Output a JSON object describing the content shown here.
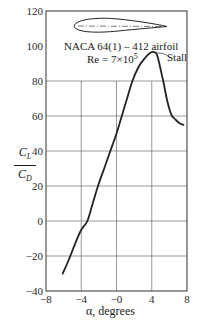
{
  "chart_data": {
    "type": "line",
    "title": "NACA 64(1) – 412 airfoil",
    "subtitle": "Re = 7×10^5",
    "xlabel": "α, degrees",
    "ylabel": "C_L / C_D",
    "xlim": [
      -8,
      8
    ],
    "ylim": [
      -40,
      120
    ],
    "xticks": [
      -8,
      -4,
      0,
      4,
      8
    ],
    "xtick_labels": [
      "−8",
      "−4",
      "−0",
      "4",
      "8"
    ],
    "yticks": [
      -40,
      -20,
      0,
      20,
      40,
      60,
      80,
      100,
      120
    ],
    "ytick_labels": [
      "−40",
      "−20",
      "0",
      "20",
      "40",
      "60",
      "80",
      "100",
      "120"
    ],
    "grid": true,
    "annotations": [
      {
        "text": "Stall",
        "x": 4.5,
        "y": 96
      }
    ],
    "series": [
      {
        "name": "C_L/C_D",
        "x": [
          -6.1,
          -5.4,
          -4.7,
          -4.0,
          -3.3,
          -2.7,
          -2.1,
          -1.4,
          -0.7,
          0.0,
          0.6,
          1.2,
          1.8,
          2.5,
          3.2,
          3.8,
          4.3,
          4.6,
          4.9,
          5.3,
          5.7,
          6.0,
          6.3,
          6.7,
          7.1,
          7.6
        ],
        "y": [
          -30,
          -22,
          -13,
          -5,
          0,
          10,
          20,
          30,
          40,
          50,
          60,
          70,
          80,
          88,
          93,
          96,
          96.5,
          95,
          89,
          80,
          70,
          64,
          60,
          58,
          56,
          55
        ]
      }
    ]
  },
  "labels": {
    "title_line1": "NACA 64(1) – 412 airfoil",
    "title_line2_prefix": "Re = 7×10",
    "title_line2_exp": "5",
    "stall": "Stall",
    "ylabel_num": "C",
    "ylabel_num_sub": "L",
    "ylabel_den": "C",
    "ylabel_den_sub": "D",
    "xlabel": "α, degrees"
  }
}
